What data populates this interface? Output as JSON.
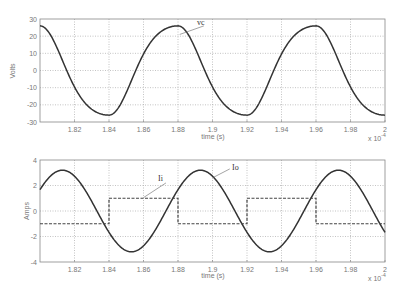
{
  "chart_data": [
    {
      "type": "line",
      "title": "",
      "xlabel": "time (s)",
      "ylabel": "Volts",
      "x_multiplier": "x 10^-4",
      "xlim": [
        1.8,
        2.0
      ],
      "ylim": [
        -30,
        30
      ],
      "xticks": [
        "1.82",
        "1.84",
        "1.86",
        "1.88",
        "1.9",
        "1.92",
        "1.94",
        "1.96",
        "1.98",
        "2"
      ],
      "yticks": [
        "30",
        "20",
        "10",
        "0",
        "-10",
        "-20",
        "-30"
      ],
      "grid": true,
      "series": [
        {
          "name": "vc",
          "style": "solid",
          "x": [
            1.8,
            1.81,
            1.82,
            1.83,
            1.84,
            1.85,
            1.86,
            1.87,
            1.88,
            1.89,
            1.9,
            1.91,
            1.92,
            1.93,
            1.94,
            1.95,
            1.96,
            1.97,
            1.98,
            1.99,
            2.0
          ],
          "values": [
            26,
            18,
            -8,
            -22,
            -26,
            -14,
            9,
            22,
            26,
            18,
            -8,
            -22,
            -26,
            -14,
            9,
            22,
            26,
            18,
            -8,
            -22,
            -26
          ]
        }
      ],
      "annotations": [
        {
          "text": "vc",
          "x": 1.895,
          "y": 26
        }
      ]
    },
    {
      "type": "line",
      "title": "",
      "xlabel": "time (s)",
      "ylabel": "Amps",
      "x_multiplier": "x 10^-4",
      "xlim": [
        1.8,
        2.0
      ],
      "ylim": [
        -4,
        4
      ],
      "xticks": [
        "1.82",
        "1.84",
        "1.86",
        "1.88",
        "1.9",
        "1.92",
        "1.94",
        "1.96",
        "1.98",
        "2"
      ],
      "yticks": [
        "4",
        "2",
        "0",
        "-2",
        "-4"
      ],
      "grid": true,
      "series": [
        {
          "name": "Io",
          "style": "solid",
          "amplitude": 3.2,
          "period": 0.08,
          "peak_at": 1.813,
          "x": [
            1.8,
            1.813,
            1.833,
            1.853,
            1.873,
            1.893,
            1.913,
            1.933,
            1.953,
            1.973,
            1.993,
            2.0
          ],
          "values": [
            1.5,
            3.2,
            0,
            -3.2,
            0,
            3.2,
            0,
            -3.2,
            0,
            3.2,
            0,
            -1.2
          ]
        },
        {
          "name": "Ii",
          "style": "dashed",
          "x": [
            1.8,
            1.84,
            1.84,
            1.88,
            1.88,
            1.92,
            1.92,
            1.96,
            1.96,
            2.0
          ],
          "values": [
            -1,
            -1,
            1,
            1,
            -1,
            -1,
            1,
            1,
            -1,
            -1
          ]
        }
      ],
      "annotations": [
        {
          "text": "Ii",
          "x": 1.858,
          "y": 2.1
        },
        {
          "text": "Io",
          "x": 1.898,
          "y": 3.4
        }
      ]
    }
  ],
  "labels": {
    "top_ylabel": "Volts",
    "bottom_ylabel": "Amps",
    "xlabel": "time (s)",
    "multiplier_base": "x 10",
    "multiplier_exp": "-4",
    "vc": "vc",
    "ii": "Ii",
    "io": "Io"
  }
}
